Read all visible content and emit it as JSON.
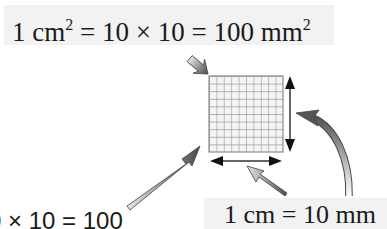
{
  "diagram": {
    "title_equation": {
      "prefix": "1 cm",
      "prefix_exp": "2",
      "middle": " = 10 × 10 = 100 mm",
      "suffix_exp": "2"
    },
    "side_length_label": "1 cm = 10 mm",
    "clipped_label": "0 × 10 = 100",
    "grid": {
      "rows": 10,
      "cols": 10,
      "line_color": "#9a9a9a",
      "cell_color": "#f4f4f4"
    },
    "arrows": [
      {
        "name": "arrow-from-title",
        "points_to": "grid-top-left-corner",
        "style": "gray-gradient-straight"
      },
      {
        "name": "arrow-from-bottom-left-label",
        "points_to": "grid-bottom-left-corner",
        "style": "gray-gradient-straight"
      },
      {
        "name": "arrow-from-side-label-to-width",
        "points_to": "width-dimension-arrow",
        "style": "gray-gradient-straight"
      },
      {
        "name": "arrow-from-side-label-to-height",
        "points_to": "height-dimension-arrow",
        "style": "gray-gradient-curved"
      }
    ],
    "dimension_arrows": [
      {
        "name": "width-dimension",
        "orientation": "horizontal"
      },
      {
        "name": "height-dimension",
        "orientation": "vertical"
      }
    ],
    "colors": {
      "background": "#ffffff",
      "label_background": "#f2f2f2",
      "text": "#1a1a1a",
      "arrow_dark": "#555555",
      "arrow_light": "#dcdcdc"
    }
  }
}
